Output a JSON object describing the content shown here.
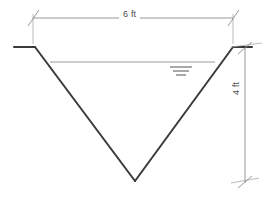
{
  "figure": {
    "canvas": {
      "width": 271,
      "height": 198,
      "background": "#ffffff"
    }
  },
  "colors": {
    "channel_wall": "#3a3a3a",
    "dimension_line": "#8c8c8c",
    "extension_line": "#a8a8a8",
    "water_line": "#8f8f8f",
    "water_symbol": "#6f6f6f",
    "text": "#4a4a4a"
  },
  "dimensions": {
    "top_width": {
      "label": "6 ft",
      "value": 6,
      "unit": "ft",
      "orientation": "horizontal",
      "tick_style": "architectural-slash"
    },
    "depth": {
      "label": "4 ft",
      "value": 4,
      "unit": "ft",
      "orientation": "vertical",
      "tick_style": "architectural-slash"
    }
  },
  "geometry": {
    "top_width_ft": 6,
    "depth_ft": 4,
    "left_bank": {
      "x1": 14,
      "y1": 47,
      "x2": 35,
      "y2": 47
    },
    "left_slope": {
      "x1": 35,
      "y1": 47,
      "x2": 135,
      "y2": 181
    },
    "right_slope": {
      "x1": 135,
      "y1": 181,
      "x2": 233,
      "y2": 47
    },
    "right_bank": {
      "x1": 233,
      "y1": 47,
      "x2": 252,
      "y2": 47
    },
    "vertex": {
      "x": 135,
      "y": 181
    },
    "water_surface": {
      "x1": 50,
      "y1": 62,
      "x2": 215,
      "y2": 62
    }
  },
  "annotations": {
    "water_surface_symbol": "water-level-symbol",
    "water_symbol_bars": 3
  }
}
